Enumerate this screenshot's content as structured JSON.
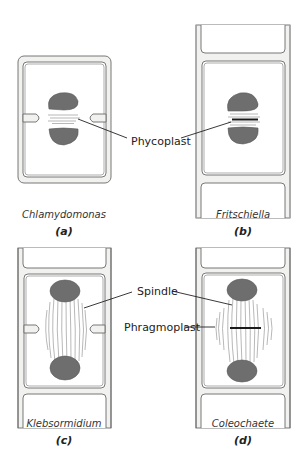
{
  "figure": {
    "labels": {
      "phycoplast": "Phycoplast",
      "spindle": "Spindle",
      "phragmoplast": "Phragmoplast"
    },
    "panels": [
      {
        "letter": "(a)",
        "species": "Chlamydomonas"
      },
      {
        "letter": "(b)",
        "species": "Fritschiella"
      },
      {
        "letter": "(c)",
        "species": "Klebsormidium"
      },
      {
        "letter": "(d)",
        "species": "Coleochaete"
      }
    ],
    "colors": {
      "nucleus": "#6e6e6e",
      "cell_wall": "#f1f1ef",
      "outline": "#6a6a6a",
      "cell_plate": "#1a1a1a"
    }
  }
}
